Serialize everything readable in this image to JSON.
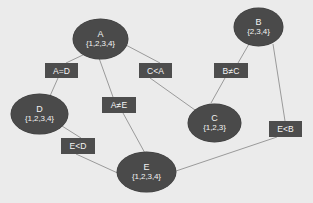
{
  "diagram": {
    "background_color": "#ebebeb",
    "node_color": "#4a4a4a",
    "node_text_color": "#f2f2f2",
    "label_box_color": "#4d4d4d",
    "label_text_color": "#f5f5f5",
    "edge_color": "#9a9a9a",
    "nodes": [
      {
        "id": "A",
        "name": "A",
        "set": "{1,2,3,4}",
        "x": 73,
        "y": 19,
        "w": 55,
        "h": 40
      },
      {
        "id": "B",
        "name": "B",
        "set": "{2,3,4}",
        "x": 234,
        "y": 8,
        "w": 49,
        "h": 38
      },
      {
        "id": "D",
        "name": "D",
        "set": "{1,2,3,4}",
        "x": 11,
        "y": 94,
        "w": 57,
        "h": 40
      },
      {
        "id": "C",
        "name": "C",
        "set": "{1,2,3}",
        "x": 188,
        "y": 104,
        "w": 53,
        "h": 38
      },
      {
        "id": "E",
        "name": "E",
        "set": "{1,2,3,4}",
        "x": 117,
        "y": 152,
        "w": 59,
        "h": 40
      }
    ],
    "edge_labels": [
      {
        "id": "A=D",
        "text": "A=D",
        "x": 45,
        "y": 63,
        "w": 33,
        "h": 15
      },
      {
        "id": "C<A",
        "text": "C<A",
        "x": 139,
        "y": 63,
        "w": 33,
        "h": 15
      },
      {
        "id": "B!=C",
        "text": "B≠C",
        "x": 214,
        "y": 63,
        "w": 34,
        "h": 15
      },
      {
        "id": "A!=E",
        "text": "A≠E",
        "x": 102,
        "y": 97,
        "w": 34,
        "h": 16
      },
      {
        "id": "E<B",
        "text": "E<B",
        "x": 269,
        "y": 121,
        "w": 33,
        "h": 16
      },
      {
        "id": "E<D",
        "text": "E<D",
        "x": 61,
        "y": 138,
        "w": 34,
        "h": 16
      }
    ],
    "edges": [
      {
        "id": "A-to-AeqD",
        "from": "A",
        "to": "A=D",
        "x1": 85,
        "y1": 54,
        "x2": 66,
        "y2": 63
      },
      {
        "id": "AeqD-to-D",
        "from": "A=D",
        "to": "D",
        "x1": 58,
        "y1": 78,
        "x2": 50,
        "y2": 96
      },
      {
        "id": "A-to-CltA",
        "from": "A",
        "to": "C<A",
        "x1": 124,
        "y1": 44,
        "x2": 160,
        "y2": 63
      },
      {
        "id": "CltA-to-C",
        "from": "C<A",
        "to": "C",
        "x1": 150,
        "y1": 78,
        "x2": 195,
        "y2": 110
      },
      {
        "id": "B-to-BneC",
        "from": "B",
        "to": "B≠C",
        "x1": 249,
        "y1": 44,
        "x2": 238,
        "y2": 63
      },
      {
        "id": "BneC-to-C",
        "from": "B≠C",
        "to": "C",
        "x1": 225,
        "y1": 78,
        "x2": 211,
        "y2": 103
      },
      {
        "id": "A-to-AneE",
        "from": "A",
        "to": "A≠E",
        "x1": 99,
        "y1": 58,
        "x2": 113,
        "y2": 97
      },
      {
        "id": "AneE-to-E",
        "from": "A≠E",
        "to": "E",
        "x1": 123,
        "y1": 113,
        "x2": 146,
        "y2": 155
      },
      {
        "id": "D-to-EltD",
        "from": "D",
        "to": "E<D",
        "x1": 62,
        "y1": 126,
        "x2": 81,
        "y2": 138
      },
      {
        "id": "EltD-to-E",
        "from": "E<D",
        "to": "E",
        "x1": 76,
        "y1": 154,
        "x2": 122,
        "y2": 175
      },
      {
        "id": "B-to-EltB",
        "from": "B",
        "to": "E<B",
        "x1": 273,
        "y1": 44,
        "x2": 285,
        "y2": 121
      },
      {
        "id": "EltB-to-E",
        "from": "E<B",
        "to": "E",
        "x1": 277,
        "y1": 137,
        "x2": 173,
        "y2": 172
      }
    ]
  }
}
